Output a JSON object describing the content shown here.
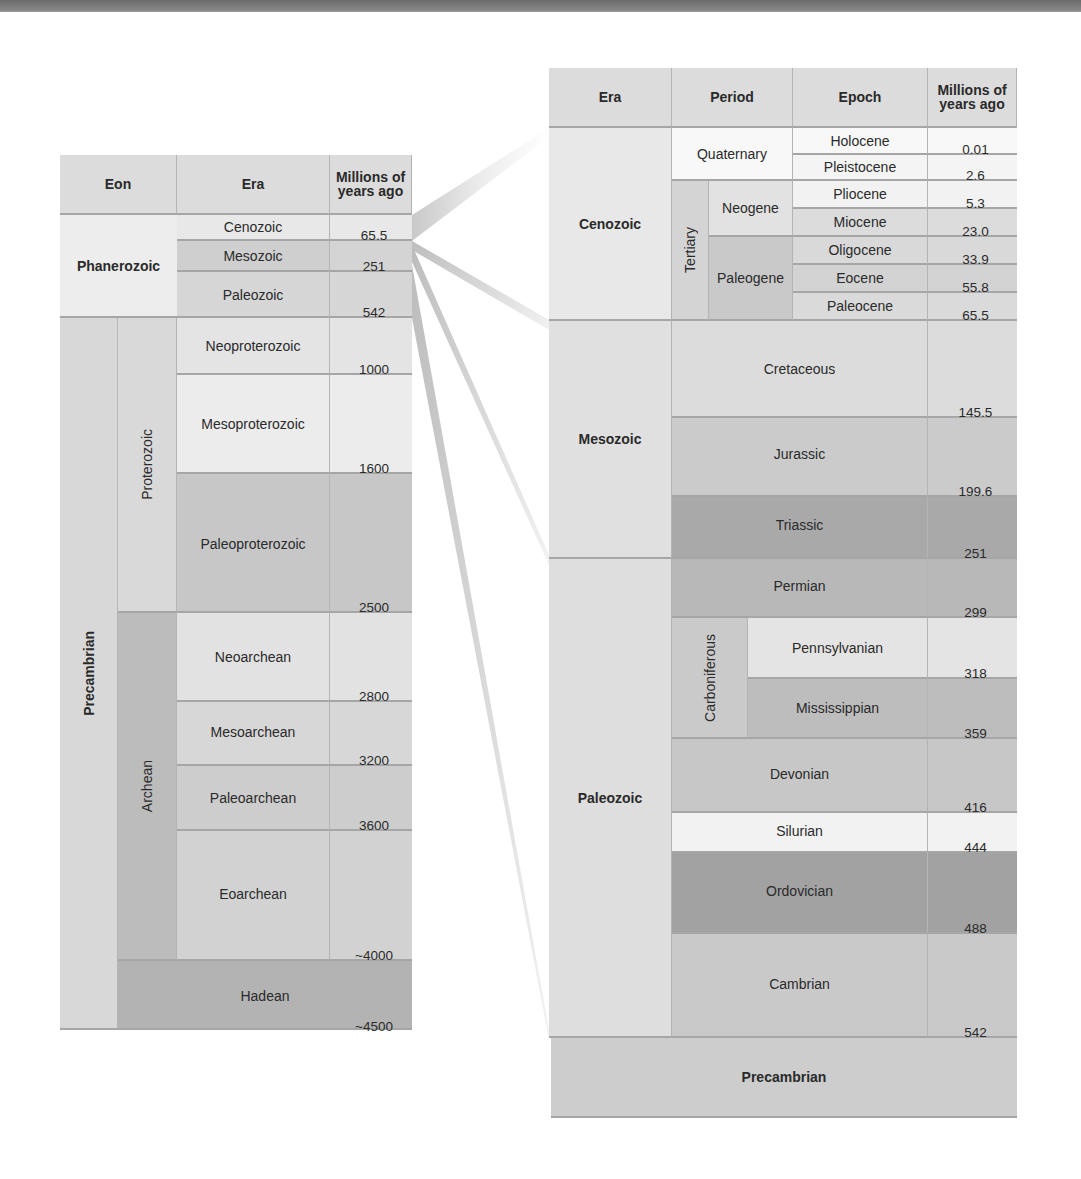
{
  "left_table": {
    "headers": {
      "eon": "Eon",
      "era": "Era",
      "mya": "Millions of years ago"
    },
    "phanerozoic": {
      "label": "Phanerozoic",
      "eras": [
        {
          "name": "Cenozoic",
          "mya": "65.5"
        },
        {
          "name": "Mesozoic",
          "mya": "251"
        },
        {
          "name": "Paleozoic",
          "mya": "542"
        }
      ]
    },
    "precambrian": {
      "label": "Precambrian",
      "proterozoic": {
        "label": "Proterozoic",
        "eras": [
          {
            "name": "Neoproterozoic",
            "mya": "1000"
          },
          {
            "name": "Mesoproterozoic",
            "mya": "1600"
          },
          {
            "name": "Paleoproterozoic",
            "mya": "2500"
          }
        ]
      },
      "archean": {
        "label": "Archean",
        "eras": [
          {
            "name": "Neoarchean",
            "mya": "2800"
          },
          {
            "name": "Mesoarchean",
            "mya": "3200"
          },
          {
            "name": "Paleoarchean",
            "mya": "3600"
          },
          {
            "name": "Eoarchean",
            "mya": "~4000"
          }
        ]
      },
      "hadean": {
        "label": "Hadean",
        "mya": "~4500"
      }
    }
  },
  "right_table": {
    "headers": {
      "era": "Era",
      "period": "Period",
      "epoch": "Epoch",
      "mya": "Millions of years ago"
    },
    "cenozoic": {
      "label": "Cenozoic",
      "quaternary": {
        "label": "Quaternary",
        "epochs": [
          {
            "name": "Holocene",
            "mya": "0.01"
          },
          {
            "name": "Pleistocene",
            "mya": "2.6"
          }
        ]
      },
      "tertiary": {
        "label": "Tertiary",
        "neogene": {
          "label": "Neogene",
          "epochs": [
            {
              "name": "Pliocene",
              "mya": "5.3"
            },
            {
              "name": "Miocene",
              "mya": "23.0"
            }
          ]
        },
        "paleogene": {
          "label": "Paleogene",
          "epochs": [
            {
              "name": "Oligocene",
              "mya": "33.9"
            },
            {
              "name": "Eocene",
              "mya": "55.8"
            },
            {
              "name": "Paleocene",
              "mya": "65.5"
            }
          ]
        }
      }
    },
    "mesozoic": {
      "label": "Mesozoic",
      "periods": [
        {
          "name": "Cretaceous",
          "mya": "145.5"
        },
        {
          "name": "Jurassic",
          "mya": "199.6"
        },
        {
          "name": "Triassic",
          "mya": "251"
        }
      ]
    },
    "paleozoic": {
      "label": "Paleozoic",
      "permian": {
        "name": "Permian",
        "mya": "299"
      },
      "carboniferous": {
        "label": "Carboniferous",
        "subperiods": [
          {
            "name": "Pennsylvanian",
            "mya": "318"
          },
          {
            "name": "Mississippian",
            "mya": "359"
          }
        ]
      },
      "periods": [
        {
          "name": "Devonian",
          "mya": "416"
        },
        {
          "name": "Silurian",
          "mya": "444"
        },
        {
          "name": "Ordovician",
          "mya": "488"
        },
        {
          "name": "Cambrian",
          "mya": "542"
        }
      ]
    },
    "precambrian": {
      "label": "Precambrian"
    }
  },
  "colors": {
    "header": "#d9d9d9",
    "lightest": "#f4f4f4",
    "light": "#e6e6e6",
    "mid": "#d2d2d2",
    "midDark": "#c4c4c4",
    "dark": "#b4b4b4",
    "darker": "#a8a8a8"
  }
}
